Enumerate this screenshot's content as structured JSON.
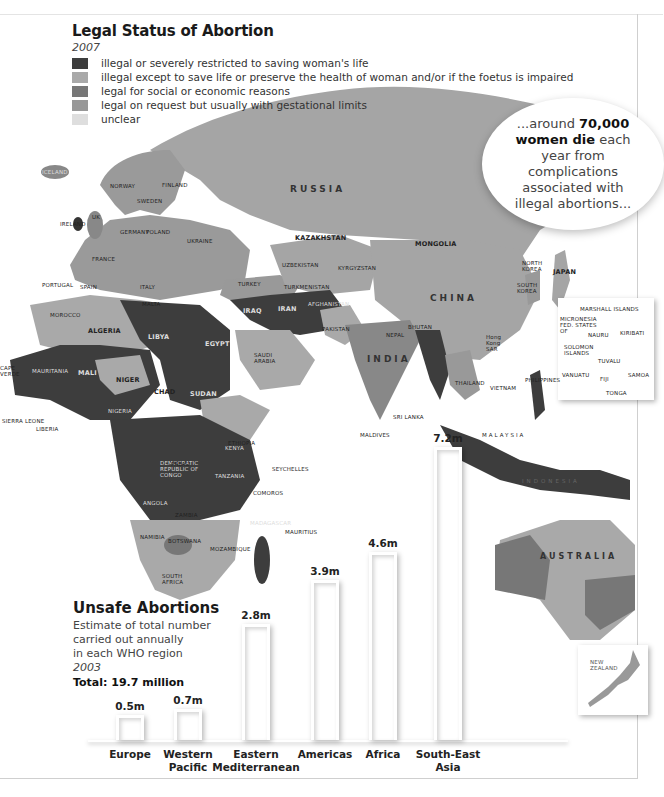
{
  "legend": {
    "title": "Legal Status of Abortion",
    "year": "2007",
    "items": [
      {
        "label": "illegal or severely restricted to saving woman's life",
        "color": "#3d3d3d"
      },
      {
        "label": "illegal except to save life or preserve the health of woman and/or if the foetus is impaired",
        "color": "#a9a9a9"
      },
      {
        "label": "legal for social or economic reasons",
        "color": "#777777"
      },
      {
        "label": "legal on request but usually with gestational limits",
        "color": "#989898"
      },
      {
        "label": "unclear",
        "color": "#dedede"
      }
    ]
  },
  "callout": {
    "prefix": "...around ",
    "bold1": "70,000",
    "bold2": "women die",
    "line1_end": " each",
    "line2": "year from",
    "line3": "complications",
    "line4": "associated with",
    "line5": "illegal abortions..."
  },
  "unsafe": {
    "title": "Unsafe Abortions",
    "desc1": "Estimate of total number",
    "desc2": "carried out annually",
    "desc3": "in each WHO region",
    "year": "2003",
    "total": "Total: 19.7 million"
  },
  "map_labels": {
    "russia": "RUSSIA",
    "china": "CHINA",
    "india": "INDIA",
    "australia": "AUSTRALIA",
    "indonesia": "INDONESIA",
    "kazakhstan": "KAZAKHSTAN",
    "mongolia": "MONGOLIA",
    "algeria": "ALGERIA",
    "libya": "LIBYA",
    "egypt": "EGYPT",
    "sudan": "SUDAN",
    "chad": "CHAD",
    "niger": "NIGER",
    "mali": "MALI",
    "mauritania": "MAURITANIA",
    "nigeria": "NIGERIA",
    "ethiopia": "ETHIOPIA",
    "angola": "ANGOLA",
    "zambia": "ZAMBIA",
    "namibia": "NAMIBIA",
    "botswana": "BOTSWANA",
    "south_africa": "SOUTH AFRICA",
    "mozambique": "MOZAMBIQUE",
    "madagascar": "MADAGASCAR",
    "tanzania": "TANZANIA",
    "kenya": "KENYA",
    "drc": "DEMOCRATIC REPUBLIC OF CONGO",
    "iran": "IRAN",
    "iraq": "IRAQ",
    "turkey": "TURKEY",
    "saudi": "SAUDI ARABIA",
    "pakistan": "PAKISTAN",
    "afghanistan": "AFGHANISTAN",
    "uzbekistan": "UZBEKISTAN",
    "turkmenistan": "TURKMENISTAN",
    "kyrgyzstan": "KYRGYZSTAN",
    "japan": "JAPAN",
    "north_korea": "NORTH KOREA",
    "south_korea": "SOUTH KOREA",
    "thailand": "THAILAND",
    "vietnam": "VIETNAM",
    "malaysia": "MALAYSIA",
    "philippines": "PHILIPPINES",
    "sri_lanka": "SRI LANKA",
    "maldives": "MALDIVES",
    "nepal": "NEPAL",
    "bhutan": "BHUTAN",
    "hong_kong": "Hong Kong SAR",
    "ukraine": "UKRAINE",
    "france": "FRANCE",
    "spain": "SPAIN",
    "portugal": "PORTUGAL",
    "germany": "GERMANY",
    "italy": "ITALY",
    "poland": "POLAND",
    "norway": "NORWAY",
    "sweden": "SWEDEN",
    "finland": "FINLAND",
    "iceland": "ICELAND",
    "ireland": "IRELAND",
    "uk": "UK",
    "morocco": "MOROCCO",
    "new_zealand": "NEW ZEALAND",
    "marshall": "MARSHALL ISLANDS",
    "micronesia": "MICRONESIA FED. STATES OF",
    "nauru": "NAURU",
    "kiribati": "KIRIBATI",
    "solomon": "SOLOMON ISLANDS",
    "tuvalu": "TUVALU",
    "vanuatu": "VANUATU",
    "fiji": "FIJI",
    "samoa": "SAMOA",
    "tonga": "TONGA",
    "palau": "PALAU",
    "seychelles": "SEYCHELLES",
    "comoros": "COMOROS",
    "mauritius": "MAURITIUS",
    "cape_verde": "CAPE VERDE",
    "guinea": "GUINEA",
    "sierra_leone": "SIERRA LEONE",
    "liberia": "LIBERIA",
    "malta": "MALTA"
  },
  "chart_data": {
    "type": "bar",
    "title": "Unsafe Abortions",
    "subtitle": "Estimate of total number carried out annually in each WHO region, 2003",
    "total": "19.7 million",
    "categories": [
      "Europe",
      "Western Pacific",
      "Eastern Mediterranean",
      "Americas",
      "Africa",
      "South-East Asia"
    ],
    "values": [
      0.5,
      0.7,
      2.8,
      3.9,
      4.6,
      7.2
    ],
    "value_labels": [
      "0.5m",
      "0.7m",
      "2.8m",
      "3.9m",
      "4.6m",
      "7.2m"
    ],
    "unit": "million",
    "xlabel": "",
    "ylabel": "",
    "ylim": [
      0,
      7.2
    ],
    "grid": false,
    "legend": "none"
  }
}
